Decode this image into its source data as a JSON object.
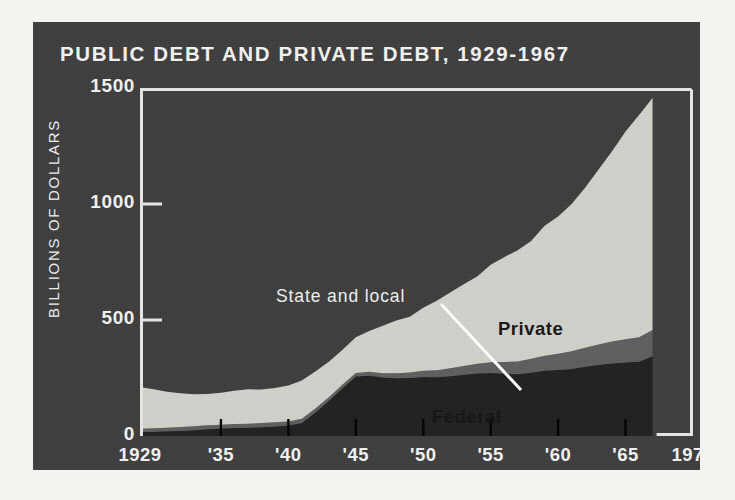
{
  "chart_data": {
    "type": "area",
    "title": "PUBLIC DEBT AND PRIVATE DEBT, 1929-1967",
    "xlabel": "",
    "ylabel": "BILLIONS OF DOLLARS",
    "stacked": true,
    "grid": false,
    "legend_position": "inline-annotations",
    "xlim": [
      1929,
      1970
    ],
    "ylim": [
      0,
      1500
    ],
    "yticks": [
      0,
      500,
      1000,
      1500
    ],
    "ytick_labels": [
      "0",
      "500",
      "1000",
      "1500"
    ],
    "xticks": [
      1929,
      1935,
      1940,
      1945,
      1950,
      1955,
      1960,
      1965,
      1970
    ],
    "xtick_labels": [
      "1929",
      "'35",
      "'40",
      "'45",
      "'50",
      "'55",
      "'60",
      "'65",
      "1970"
    ],
    "x": [
      1929,
      1930,
      1931,
      1932,
      1933,
      1934,
      1935,
      1936,
      1937,
      1938,
      1939,
      1940,
      1941,
      1942,
      1943,
      1944,
      1945,
      1946,
      1947,
      1948,
      1949,
      1950,
      1951,
      1952,
      1953,
      1954,
      1955,
      1956,
      1957,
      1958,
      1959,
      1960,
      1961,
      1962,
      1963,
      1964,
      1965,
      1966,
      1967
    ],
    "series": [
      {
        "name": "Federal",
        "color": "#1f1f1f",
        "values": [
          17,
          18,
          20,
          22,
          25,
          29,
          32,
          35,
          36,
          38,
          41,
          45,
          56,
          101,
          151,
          205,
          256,
          260,
          252,
          249,
          250,
          254,
          253,
          258,
          264,
          269,
          272,
          268,
          266,
          273,
          281,
          284,
          289,
          298,
          306,
          312,
          317,
          320,
          344
        ]
      },
      {
        "name": "State and local",
        "color": "#5e5e5e",
        "values": [
          14,
          15,
          16,
          17,
          17,
          17,
          17,
          17,
          17,
          18,
          18,
          18,
          18,
          17,
          16,
          16,
          16,
          17,
          19,
          21,
          24,
          27,
          30,
          34,
          38,
          42,
          46,
          51,
          55,
          60,
          65,
          70,
          76,
          82,
          88,
          95,
          100,
          106,
          113
        ]
      },
      {
        "name": "Private",
        "color": "#d2d2cd",
        "values": [
          180,
          168,
          155,
          145,
          138,
          135,
          137,
          143,
          148,
          144,
          148,
          155,
          165,
          160,
          153,
          150,
          154,
          176,
          204,
          228,
          240,
          272,
          300,
          326,
          352,
          376,
          420,
          452,
          480,
          508,
          560,
          592,
          635,
          690,
          755,
          820,
          895,
          958,
          1000
        ]
      }
    ],
    "totals": [
      211,
      201,
      191,
      184,
      180,
      181,
      186,
      195,
      201,
      200,
      207,
      218,
      239,
      278,
      320,
      371,
      426,
      453,
      475,
      498,
      514,
      553,
      583,
      618,
      654,
      687,
      738,
      771,
      801,
      841,
      906,
      946,
      1000,
      1070,
      1149,
      1227,
      1312,
      1384,
      1457
    ],
    "annotations": [
      {
        "name": "state-and-local",
        "text": "State and local",
        "style": "light",
        "leader_line": true
      },
      {
        "name": "private",
        "text": "Private",
        "style": "dark",
        "leader_line": false
      },
      {
        "name": "federal",
        "text": "Federal",
        "style": "dark",
        "leader_line": false
      }
    ],
    "colors": {
      "panel_background": "#3d3d3d",
      "page_background": "#f4f3f0",
      "frame": "#e8e8e4",
      "federal": "#1f1f1f",
      "state_and_local": "#5e5e5e",
      "private": "#d2d2cd",
      "text_light": "#f4f4f2",
      "text_dark": "#151515"
    }
  }
}
